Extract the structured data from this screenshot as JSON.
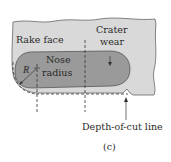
{
  "figure": {
    "caption": "(c)",
    "labels": {
      "rake_face": "Rake face",
      "crater_line1": "Crater",
      "crater_line2": "wear",
      "nose_line1": "Nose",
      "nose_line2": "radius",
      "radius_symbol": "R",
      "depth_of_cut": "Depth-of-cut line"
    },
    "colors": {
      "rake_face_fill": "#d9d9d9",
      "crater_fill": "#9a9a9a",
      "outline": "#555555",
      "dashed": "#333333",
      "text": "#2a2a2a"
    }
  }
}
